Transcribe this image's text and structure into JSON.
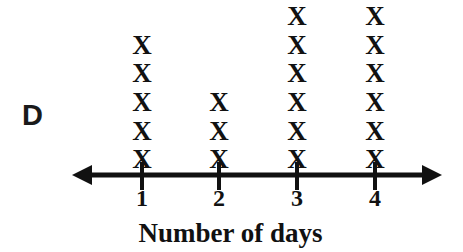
{
  "choice": {
    "label": "D"
  },
  "axis": {
    "title": "Number of days",
    "tick_labels": [
      "1",
      "2",
      "3",
      "4"
    ],
    "line_color": "#111111",
    "left_arrow": true,
    "right_arrow": true
  },
  "mark": {
    "glyph": "X"
  },
  "chart_data": {
    "type": "scatter",
    "plot_kind": "line-plot-dot-plot-with-X-marks",
    "title": "",
    "xlabel": "Number of days",
    "ylabel": "",
    "categories": [
      "1",
      "2",
      "3",
      "4"
    ],
    "values": [
      5,
      3,
      6,
      7
    ],
    "counts_note": "stack of X marks above each tick; the top X of the 4 column is clipped by the top image edge",
    "x": [
      1,
      2,
      3,
      4
    ],
    "xlim": [
      0,
      5
    ],
    "grid": false,
    "legend": null,
    "tick_labels": [
      "1",
      "2",
      "3",
      "4"
    ],
    "marker": "X",
    "columns": [
      {
        "category": "1",
        "count": 5,
        "clipped_top": false
      },
      {
        "category": "2",
        "count": 3,
        "clipped_top": false
      },
      {
        "category": "3",
        "count": 6,
        "clipped_top": false
      },
      {
        "category": "4",
        "count": 7,
        "clipped_top": true
      }
    ]
  }
}
